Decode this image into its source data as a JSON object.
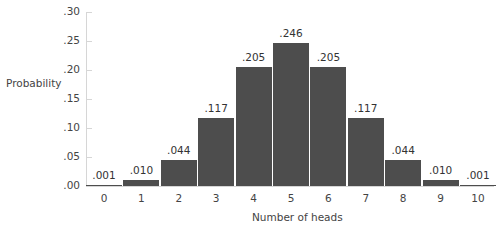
{
  "chart_data": {
    "type": "bar",
    "title": "",
    "xlabel": "Number of heads",
    "ylabel": "Probability",
    "categories": [
      "0",
      "1",
      "2",
      "3",
      "4",
      "5",
      "6",
      "7",
      "8",
      "9",
      "10"
    ],
    "values": [
      0.001,
      0.01,
      0.044,
      0.117,
      0.205,
      0.246,
      0.205,
      0.117,
      0.044,
      0.01,
      0.001
    ],
    "data_labels": [
      ".001",
      ".010",
      ".044",
      ".117",
      ".205",
      ".246",
      ".205",
      ".117",
      ".044",
      ".010",
      ".001"
    ],
    "yticks": [
      ".00",
      ".05",
      ".10",
      ".15",
      ".20",
      ".25",
      ".30"
    ],
    "ylim": [
      0,
      0.3
    ],
    "grid": false,
    "legend": null,
    "bar_color": "#4d4d4d"
  },
  "axes": {
    "ylabel": "Probability",
    "xlabel": "Number of heads"
  }
}
